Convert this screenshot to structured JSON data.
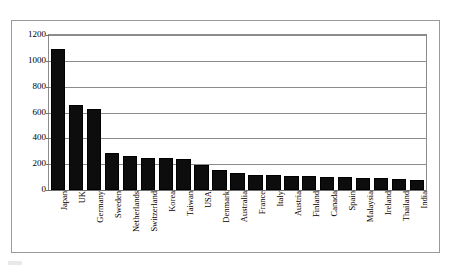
{
  "chart_data": {
    "type": "bar",
    "title": "",
    "subtitle": "",
    "xlabel": "",
    "ylabel": "",
    "ylim": [
      0,
      1200
    ],
    "yticks": [
      0,
      200,
      400,
      600,
      800,
      1000,
      1200
    ],
    "ytick_labels": [
      "0",
      "200",
      "400",
      "600",
      "800",
      "1000",
      "1200"
    ],
    "grid": true,
    "legend": false,
    "legend_position": "none",
    "orientation": "vertical",
    "bar_color": "#000000",
    "categories": [
      "Japan",
      "UK",
      "Germany",
      "Sweden",
      "Netherlands",
      "Switzerland",
      "Korea",
      "Taiwan",
      "USA",
      "Denmark",
      "Australia",
      "France",
      "Italy",
      "Austria",
      "Finland",
      "Canada",
      "Spain",
      "Malaysia",
      "Ireland",
      "Thailand",
      "India"
    ],
    "values": [
      1095,
      655,
      630,
      290,
      265,
      250,
      250,
      240,
      190,
      155,
      130,
      120,
      115,
      105,
      105,
      100,
      100,
      95,
      95,
      85,
      75
    ]
  },
  "frame": {
    "border_color": "#9a9a9a",
    "background": "#ffffff"
  }
}
